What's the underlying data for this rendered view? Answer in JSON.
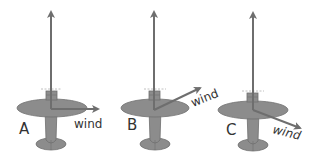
{
  "diagram": {
    "colors": {
      "airplane_fill": "#8c8c8c",
      "airplane_stroke": "#6e6e6e",
      "arrow": "#6e6e6e",
      "label": "#333333",
      "prop_dash": "#b0b0b0"
    },
    "planes": [
      {
        "id": "A",
        "label": "A",
        "wind_label": "wind",
        "wind_direction": "right (perpendicular)"
      },
      {
        "id": "B",
        "label": "B",
        "wind_label": "wind",
        "wind_direction": "up-right (forward diagonal)"
      },
      {
        "id": "C",
        "label": "C",
        "wind_label": "wind",
        "wind_direction": "down-right (backward diagonal)"
      }
    ]
  }
}
